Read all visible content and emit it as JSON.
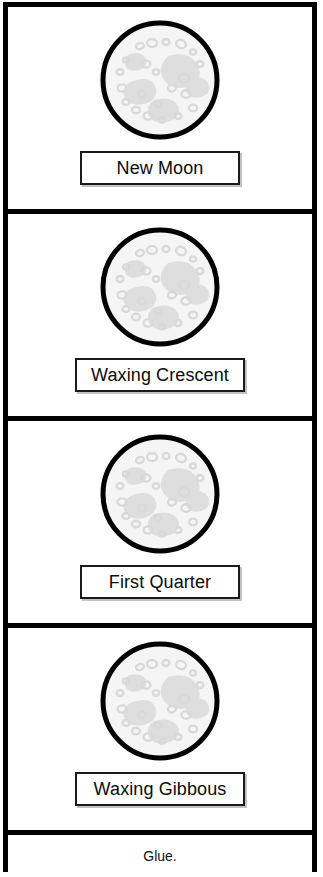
{
  "worksheet": {
    "title": "Moon Phases Foldable Strip",
    "orientation": "vertical-strip",
    "border_color": "#000000",
    "background_color": "#ffffff",
    "label_text_color": "#0b0b0b",
    "moon_fill_color": "#f5f5f5",
    "moon_crater_color": "#dcdcdc",
    "moon_outline_color": "#000000"
  },
  "panels": [
    {
      "index": 1,
      "icon": "full-moon-icon",
      "label": "New Moon",
      "label_box_width": "narrow"
    },
    {
      "index": 2,
      "icon": "full-moon-icon",
      "label": "Waxing Crescent",
      "label_box_width": "wide"
    },
    {
      "index": 3,
      "icon": "full-moon-icon",
      "label": "First Quarter",
      "label_box_width": "narrow"
    },
    {
      "index": 4,
      "icon": "full-moon-icon",
      "label": "Waxing Gibbous",
      "label_box_width": "wide"
    }
  ],
  "glue_strip": {
    "text": "Glue."
  }
}
